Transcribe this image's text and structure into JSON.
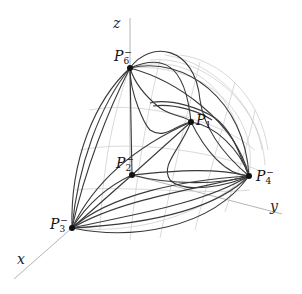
{
  "diagram": {
    "type": "3d-sphere-octant-curves",
    "axes": [
      {
        "name": "z",
        "label": "z"
      },
      {
        "name": "y",
        "label": "y"
      },
      {
        "name": "x",
        "label": "x"
      }
    ],
    "points": [
      {
        "id": "P6",
        "base": "P",
        "sub": "6",
        "sup": "−",
        "x": 130,
        "y": 68
      },
      {
        "id": "P1",
        "base": "P",
        "sub": "1",
        "sup": "",
        "x": 191,
        "y": 122
      },
      {
        "id": "P2",
        "base": "P",
        "sub": "2",
        "sup": "−",
        "x": 132,
        "y": 175
      },
      {
        "id": "P4",
        "base": "P",
        "sub": "4",
        "sup": "−",
        "x": 249,
        "y": 176
      },
      {
        "id": "P3",
        "base": "P",
        "sub": "3",
        "sup": "−",
        "x": 72,
        "y": 228
      }
    ],
    "colors": {
      "curve": "#333333",
      "grid": "#c8c8c8",
      "axis": "#b0b0b0",
      "point": "#111111"
    }
  }
}
